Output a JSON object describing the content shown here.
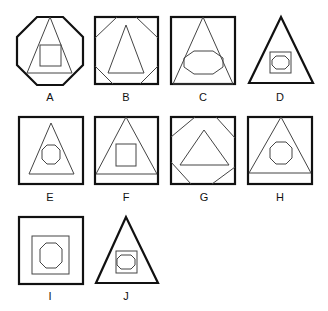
{
  "figure": {
    "type": "shape-options-grid",
    "options": [
      {
        "label": "A",
        "outer": "octagon",
        "middle": "triangle",
        "inner": "square"
      },
      {
        "label": "B",
        "outer": "square with cut corners",
        "middle": "triangle",
        "inner": "none"
      },
      {
        "label": "C",
        "outer": "square",
        "middle": "triangle",
        "inner": "octagon"
      },
      {
        "label": "D",
        "outer": "triangle",
        "middle": "square",
        "inner": "octagon"
      },
      {
        "label": "E",
        "outer": "square",
        "middle": "triangle",
        "inner": "octagon"
      },
      {
        "label": "F",
        "outer": "square",
        "middle": "triangle",
        "inner": "square"
      },
      {
        "label": "G",
        "outer": "square with cut corners",
        "middle": "triangle",
        "inner": "none"
      },
      {
        "label": "H",
        "outer": "square",
        "middle": "triangle",
        "inner": "octagon"
      },
      {
        "label": "I",
        "outer": "square",
        "middle": "square",
        "inner": "octagon"
      },
      {
        "label": "J",
        "outer": "triangle",
        "middle": "square",
        "inner": "octagon"
      }
    ]
  }
}
